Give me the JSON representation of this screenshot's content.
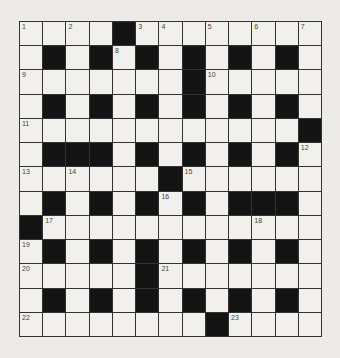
{
  "puzzle": {
    "rows": 13,
    "cols": 13,
    "grid": [
      [
        0,
        0,
        0,
        0,
        1,
        0,
        0,
        0,
        0,
        0,
        0,
        0,
        0
      ],
      [
        0,
        1,
        0,
        1,
        0,
        1,
        0,
        1,
        0,
        1,
        0,
        1,
        0
      ],
      [
        0,
        0,
        0,
        0,
        0,
        0,
        0,
        1,
        0,
        0,
        0,
        0,
        0
      ],
      [
        0,
        1,
        0,
        1,
        0,
        1,
        0,
        1,
        0,
        1,
        0,
        1,
        0
      ],
      [
        0,
        0,
        0,
        0,
        0,
        0,
        0,
        0,
        0,
        0,
        0,
        0,
        1
      ],
      [
        0,
        1,
        1,
        1,
        0,
        1,
        0,
        1,
        0,
        1,
        0,
        1,
        0
      ],
      [
        0,
        0,
        0,
        0,
        0,
        0,
        1,
        0,
        0,
        0,
        0,
        0,
        0
      ],
      [
        0,
        1,
        0,
        1,
        0,
        1,
        0,
        1,
        0,
        1,
        1,
        1,
        0
      ],
      [
        1,
        0,
        0,
        0,
        0,
        0,
        0,
        0,
        0,
        0,
        0,
        0,
        0
      ],
      [
        0,
        1,
        0,
        1,
        0,
        1,
        0,
        1,
        0,
        1,
        0,
        1,
        0
      ],
      [
        0,
        0,
        0,
        0,
        0,
        1,
        0,
        0,
        0,
        0,
        0,
        0,
        0
      ],
      [
        0,
        1,
        0,
        1,
        0,
        1,
        0,
        1,
        0,
        1,
        0,
        1,
        0
      ],
      [
        0,
        0,
        0,
        0,
        0,
        0,
        0,
        0,
        1,
        0,
        0,
        0,
        0
      ]
    ],
    "numbers": [
      {
        "r": 0,
        "c": 0,
        "n": "1"
      },
      {
        "r": 0,
        "c": 2,
        "n": "2"
      },
      {
        "r": 0,
        "c": 5,
        "n": "3"
      },
      {
        "r": 0,
        "c": 6,
        "n": "4"
      },
      {
        "r": 0,
        "c": 8,
        "n": "5"
      },
      {
        "r": 0,
        "c": 10,
        "n": "6"
      },
      {
        "r": 0,
        "c": 12,
        "n": "7"
      },
      {
        "r": 1,
        "c": 4,
        "n": "8"
      },
      {
        "r": 2,
        "c": 0,
        "n": "9"
      },
      {
        "r": 2,
        "c": 8,
        "n": "10"
      },
      {
        "r": 4,
        "c": 0,
        "n": "11"
      },
      {
        "r": 5,
        "c": 12,
        "n": "12"
      },
      {
        "r": 6,
        "c": 0,
        "n": "13"
      },
      {
        "r": 6,
        "c": 2,
        "n": "14"
      },
      {
        "r": 6,
        "c": 7,
        "n": "15"
      },
      {
        "r": 7,
        "c": 6,
        "n": "16"
      },
      {
        "r": 8,
        "c": 1,
        "n": "17"
      },
      {
        "r": 8,
        "c": 10,
        "n": "18"
      },
      {
        "r": 9,
        "c": 0,
        "n": "19"
      },
      {
        "r": 10,
        "c": 0,
        "n": "20"
      },
      {
        "r": 10,
        "c": 6,
        "n": "21"
      },
      {
        "r": 12,
        "c": 0,
        "n": "22"
      },
      {
        "r": 12,
        "c": 9,
        "n": "23"
      }
    ]
  }
}
